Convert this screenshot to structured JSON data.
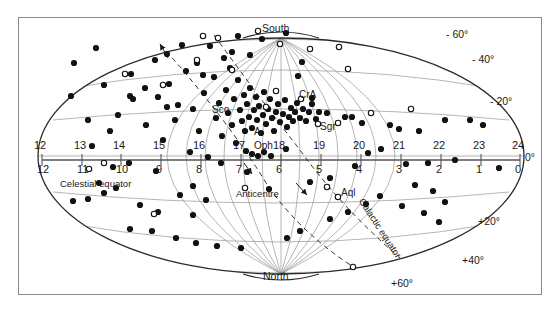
{
  "figure": {
    "type": "all-sky-map",
    "projection": "aitoff-elliptical"
  },
  "poles": {
    "south_label": "South",
    "north_label": "North"
  },
  "axes": {
    "ra_label_row": [
      "12",
      "13",
      "14",
      "15",
      "16",
      "17",
      "18",
      "19",
      "20",
      "21",
      "22",
      "23",
      "24"
    ],
    "galactic_label_row": [
      "12",
      "11",
      "10",
      "9",
      "8",
      "7",
      "6",
      "5",
      "4",
      "3",
      "2",
      "1",
      "0"
    ],
    "ra_zero_mark": "0°",
    "celestial_equator_label": "Celestial equator",
    "galactic_equator_label": "Galactic equator",
    "anticentre_label": "Anticentre"
  },
  "declinations": {
    "south": [
      "- 60°",
      "- 40°",
      "- 20°"
    ],
    "north": [
      "+20°",
      "+40°",
      "+60°"
    ]
  },
  "constellations": [
    {
      "name": "Sco",
      "x": 212,
      "y": 104
    },
    {
      "name": "CrA",
      "x": 299,
      "y": 89
    },
    {
      "name": "Sgr",
      "x": 320,
      "y": 121
    },
    {
      "name": "Oph",
      "x": 254,
      "y": 140
    },
    {
      "name": "Aql",
      "x": 341,
      "y": 187
    },
    {
      "name": "A",
      "x": 254,
      "y": 126
    }
  ],
  "markers": {
    "filled_legend": "filled-circle",
    "open_legend": "open-circle",
    "filled": [
      [
        71,
        96
      ],
      [
        74,
        63
      ],
      [
        96,
        48
      ],
      [
        104,
        85
      ],
      [
        118,
        115
      ],
      [
        131,
        74
      ],
      [
        133,
        99
      ],
      [
        146,
        125
      ],
      [
        155,
        60
      ],
      [
        158,
        97
      ],
      [
        163,
        140
      ],
      [
        167,
        54
      ],
      [
        169,
        84
      ],
      [
        175,
        120
      ],
      [
        182,
        45
      ],
      [
        186,
        71
      ],
      [
        190,
        152
      ],
      [
        193,
        109
      ],
      [
        197,
        63
      ],
      [
        199,
        131
      ],
      [
        204,
        93
      ],
      [
        208,
        157
      ],
      [
        210,
        46
      ],
      [
        214,
        77
      ],
      [
        216,
        118
      ],
      [
        219,
        103
      ],
      [
        222,
        136
      ],
      [
        224,
        58
      ],
      [
        226,
        90
      ],
      [
        228,
        113
      ],
      [
        230,
        68
      ],
      [
        232,
        125
      ],
      [
        234,
        99
      ],
      [
        236,
        143
      ],
      [
        238,
        80
      ],
      [
        240,
        110
      ],
      [
        242,
        121
      ],
      [
        244,
        95
      ],
      [
        245,
        131
      ],
      [
        247,
        104
      ],
      [
        249,
        117
      ],
      [
        250,
        88
      ],
      [
        252,
        128
      ],
      [
        254,
        110
      ],
      [
        256,
        97
      ],
      [
        257,
        120
      ],
      [
        259,
        106
      ],
      [
        261,
        133
      ],
      [
        263,
        115
      ],
      [
        264,
        92
      ],
      [
        266,
        124
      ],
      [
        268,
        109
      ],
      [
        270,
        99
      ],
      [
        272,
        118
      ],
      [
        274,
        131
      ],
      [
        276,
        112
      ],
      [
        278,
        104
      ],
      [
        280,
        122
      ],
      [
        283,
        114
      ],
      [
        285,
        100
      ],
      [
        287,
        127
      ],
      [
        289,
        117
      ],
      [
        291,
        108
      ],
      [
        293,
        121
      ],
      [
        295,
        112
      ],
      [
        297,
        103
      ],
      [
        300,
        118
      ],
      [
        303,
        109
      ],
      [
        306,
        121
      ],
      [
        309,
        112
      ],
      [
        312,
        104
      ],
      [
        316,
        119
      ],
      [
        319,
        112
      ],
      [
        246,
        151
      ],
      [
        252,
        154
      ],
      [
        258,
        156
      ],
      [
        264,
        152
      ],
      [
        271,
        156
      ],
      [
        286,
        149
      ],
      [
        298,
        76
      ],
      [
        302,
        62
      ],
      [
        312,
        98
      ],
      [
        327,
        113
      ],
      [
        345,
        117
      ],
      [
        352,
        117
      ],
      [
        362,
        123
      ],
      [
        368,
        153
      ],
      [
        381,
        149
      ],
      [
        390,
        125
      ],
      [
        399,
        129
      ],
      [
        406,
        164
      ],
      [
        419,
        131
      ],
      [
        428,
        163
      ],
      [
        445,
        120
      ],
      [
        455,
        160
      ],
      [
        470,
        120
      ],
      [
        483,
        125
      ],
      [
        499,
        168
      ],
      [
        238,
        36
      ],
      [
        262,
        39
      ],
      [
        286,
        33
      ],
      [
        232,
        52
      ],
      [
        250,
        55
      ],
      [
        193,
        186
      ],
      [
        206,
        200
      ],
      [
        180,
        195
      ],
      [
        158,
        212
      ],
      [
        140,
        205
      ],
      [
        116,
        188
      ],
      [
        104,
        193
      ],
      [
        99,
        183
      ],
      [
        88,
        199
      ],
      [
        73,
        201
      ],
      [
        130,
        229
      ],
      [
        152,
        231
      ],
      [
        176,
        238
      ],
      [
        196,
        243
      ],
      [
        217,
        246
      ],
      [
        241,
        248
      ],
      [
        287,
        238
      ],
      [
        300,
        231
      ],
      [
        330,
        219
      ],
      [
        348,
        212
      ],
      [
        366,
        204
      ],
      [
        380,
        196
      ],
      [
        402,
        206
      ],
      [
        424,
        213
      ],
      [
        439,
        222
      ],
      [
        330,
        178
      ],
      [
        310,
        182
      ],
      [
        269,
        189
      ],
      [
        355,
        166
      ],
      [
        247,
        172
      ],
      [
        221,
        163
      ],
      [
        156,
        171
      ],
      [
        129,
        163
      ],
      [
        113,
        167
      ],
      [
        193,
        215
      ],
      [
        415,
        185
      ],
      [
        433,
        191
      ],
      [
        445,
        202
      ],
      [
        130,
        96
      ],
      [
        110,
        131
      ],
      [
        88,
        120
      ],
      [
        92,
        146
      ],
      [
        178,
        105
      ],
      [
        203,
        75
      ],
      [
        167,
        107
      ],
      [
        145,
        88
      ]
    ],
    "open": [
      [
        203,
        36
      ],
      [
        218,
        38
      ],
      [
        258,
        31
      ],
      [
        280,
        44
      ],
      [
        310,
        49
      ],
      [
        339,
        47
      ],
      [
        348,
        69
      ],
      [
        125,
        74
      ],
      [
        163,
        85
      ],
      [
        197,
        60
      ],
      [
        232,
        70
      ],
      [
        276,
        91
      ],
      [
        301,
        99
      ],
      [
        318,
        124
      ],
      [
        338,
        123
      ],
      [
        371,
        113
      ],
      [
        411,
        109
      ],
      [
        104,
        163
      ],
      [
        327,
        187
      ],
      [
        338,
        197
      ],
      [
        245,
        188
      ],
      [
        154,
        214
      ],
      [
        353,
        267
      ],
      [
        89,
        169
      ],
      [
        266,
        107
      ]
    ]
  },
  "colors": {
    "frame": "#8d8d8d",
    "grid": "#8a8a8a",
    "outline": "#2a2a2a",
    "marker": "#111111",
    "axis_line": "#555555"
  }
}
